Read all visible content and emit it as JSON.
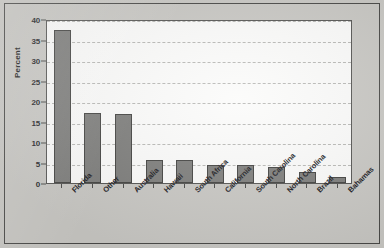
{
  "chart_data": {
    "type": "bar",
    "title": "",
    "xlabel": "",
    "ylabel": "Percent",
    "ylim": [
      0,
      40
    ],
    "yticks": [
      0,
      5,
      10,
      15,
      20,
      25,
      30,
      35,
      40
    ],
    "ytick_labels": [
      "0",
      "5",
      "10",
      "15",
      "20",
      "25",
      "30",
      "35",
      "40"
    ],
    "grid": true,
    "legend": false,
    "categories": [
      "Florida",
      "Other",
      "Australia",
      "Hawaii",
      "South Africa",
      "California",
      "South Carolina",
      "North Carolina",
      "Brazil",
      "Bahamas"
    ],
    "values": [
      37.3,
      17.0,
      16.9,
      5.7,
      5.6,
      4.5,
      4.5,
      3.8,
      2.7,
      1.5
    ],
    "bar_color": "#7e7e7c",
    "bar_edge_color": "#434341",
    "plot_background": "#fbfbfa",
    "figure_background": "#c9c8c4",
    "gridline_color": "#b9b9b6"
  }
}
